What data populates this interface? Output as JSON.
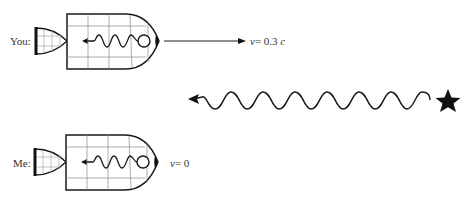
{
  "diagram": {
    "you": {
      "label": "You:",
      "velocity_var": "v",
      "velocity_eq": "= 0.3 ",
      "velocity_unit": "c"
    },
    "me": {
      "label": "Me:",
      "velocity_var": "v",
      "velocity_eq": "= 0"
    },
    "source": {
      "icon": "star-icon",
      "description": "light source emitting wave toward left"
    },
    "colors": {
      "line": "#1a1a1a",
      "grid": "#8a8a8a",
      "background": "#ffffff"
    }
  }
}
